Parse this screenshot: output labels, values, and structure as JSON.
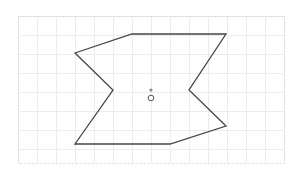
{
  "canvas": {
    "width": 299,
    "height": 171,
    "background": "#ffffff",
    "grid": {
      "x0": 18,
      "y0": 16,
      "x1": 284,
      "y1": 163,
      "spacing": 19,
      "line_color": "#ececec",
      "border_color": "#d8d8d8"
    }
  },
  "shape": {
    "type": "polygon",
    "stroke": "#444444",
    "stroke_width": 1.3,
    "fill": "none",
    "points": [
      [
        75,
        53
      ],
      [
        132,
        34
      ],
      [
        226,
        34
      ],
      [
        189,
        90
      ],
      [
        226,
        126
      ],
      [
        170,
        144
      ],
      [
        75,
        144
      ],
      [
        113,
        90
      ]
    ]
  },
  "handles": {
    "center_dot": {
      "cx": 151,
      "cy": 90,
      "r": 1.6,
      "fill": "#888888"
    },
    "rotate_handle": {
      "cx": 151,
      "cy": 98,
      "r": 2.8,
      "stroke": "#555555"
    }
  }
}
